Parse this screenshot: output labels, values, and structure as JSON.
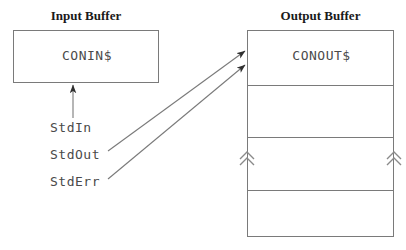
{
  "diagram": {
    "input_section": {
      "title": "Input Buffer",
      "buffer_name": "CONIN$"
    },
    "output_section": {
      "title": "Output Buffer",
      "buffer_name": "CONOUT$",
      "row_count": 4
    },
    "streams": [
      {
        "name": "StdIn",
        "target": "CONIN$"
      },
      {
        "name": "StdOut",
        "target": "CONOUT$"
      },
      {
        "name": "StdErr",
        "target": "CONOUT$"
      }
    ],
    "scroll_markers": {
      "left": "double-chevron-up",
      "right": "double-chevron-up"
    },
    "colors": {
      "stroke": "#7a7a7a",
      "text": "#4a4a4a",
      "title_text": "#1a1a1a",
      "arrow": "#3a3a3a",
      "background": "#ffffff"
    }
  }
}
